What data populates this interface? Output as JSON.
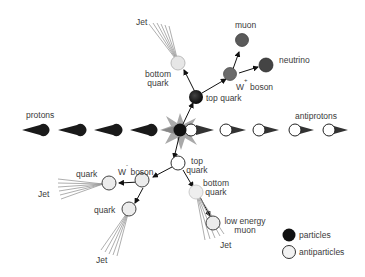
{
  "diagram": {
    "beams": {
      "left_label": "protons",
      "right_label": "antiprotons"
    },
    "upper_branch": {
      "top_quark": "top quark",
      "bottom_quark_line1": "bottom",
      "bottom_quark_line2": "quark",
      "jet": "Jet",
      "w_boson_w": "W",
      "w_boson_sign": "+",
      "w_boson_rest": "boson",
      "muon": "muon",
      "neutrino": "neutrino"
    },
    "lower_branch": {
      "top_quark_line1": "top",
      "top_quark_line2": "quark",
      "w_boson_w": "W",
      "w_boson_sign": "-",
      "w_boson_rest": "boson",
      "quark_left": "quark",
      "jet_left": "Jet",
      "quark_bottom": "quark",
      "jet_bottom": "Jet",
      "bottom_quark_line1": "bottom",
      "bottom_quark_line2": "quark",
      "low_energy_muon_line1": "low energy",
      "low_energy_muon_line2": "muon",
      "jet_right": "Jet"
    },
    "legend": {
      "particles": "particles",
      "antiparticles": "antiparticles"
    },
    "colors": {
      "particle": "#111111",
      "antiparticle": "#f2f2f2",
      "w_plus": "#6a6a6a",
      "muon": "#5a5a5a",
      "neutrino": "#444444",
      "flash": "#9a9a9a",
      "jet_lines": "#888888"
    }
  }
}
